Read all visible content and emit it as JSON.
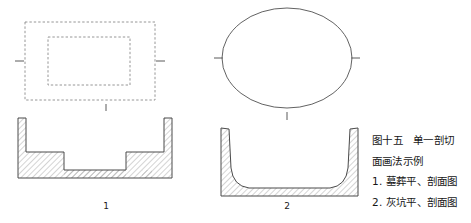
{
  "figure": {
    "caption": {
      "title_line_1": "图十五　单一剖切",
      "title_line_2": "面画法示例",
      "item_1": "1. 墓葬平、剖面图",
      "item_2": "2. 灰坑平、剖面图"
    },
    "labels": {
      "tomb_figure_number": "1",
      "ashpit_figure_number": "2",
      "tomb_plan_section_mark": "l",
      "ashpit_plan_section_mark": "l"
    },
    "panels": [
      {
        "id": "tomb",
        "number": "1",
        "plan": {
          "name": "tomb-plan-view",
          "style": "dashed-rectangle",
          "outer_rect": {
            "x": 25,
            "y": 22,
            "width": 130,
            "height": 78
          },
          "inner_rect": {
            "x": 48,
            "y": 37,
            "width": 82,
            "height": 48
          },
          "tick_marks": [
            "left",
            "right"
          ]
        },
        "section": {
          "name": "tomb-section-view",
          "style": "stepped-pit-hatched",
          "outline_points": "18,118 18,178 48,178 48,160 142,160 142,178 172,178 172,118 164,118 164,152 126,152 126,170 64,170 64,152 26,152 26,118",
          "hatch": {
            "angle_deg": 45,
            "spacing_px": 3
          }
        }
      },
      {
        "id": "ashpit",
        "number": "2",
        "plan": {
          "name": "ashpit-plan-view",
          "style": "solid-circle",
          "circle": {
            "cx": 287,
            "cy": 58,
            "rx": 65,
            "ry": 50
          },
          "tick_marks": [
            "left",
            "right"
          ]
        },
        "section": {
          "name": "ashpit-section-view",
          "style": "round-bottom-bowl-hatched",
          "hatch": {
            "angle_deg": 45,
            "spacing_px": 3
          }
        }
      }
    ],
    "colors": {
      "line": "#3a3a3a",
      "hatch": "#8c8c8c",
      "dashed": "#8a8a8a",
      "text": "#161616",
      "background": "#ffffff"
    }
  }
}
